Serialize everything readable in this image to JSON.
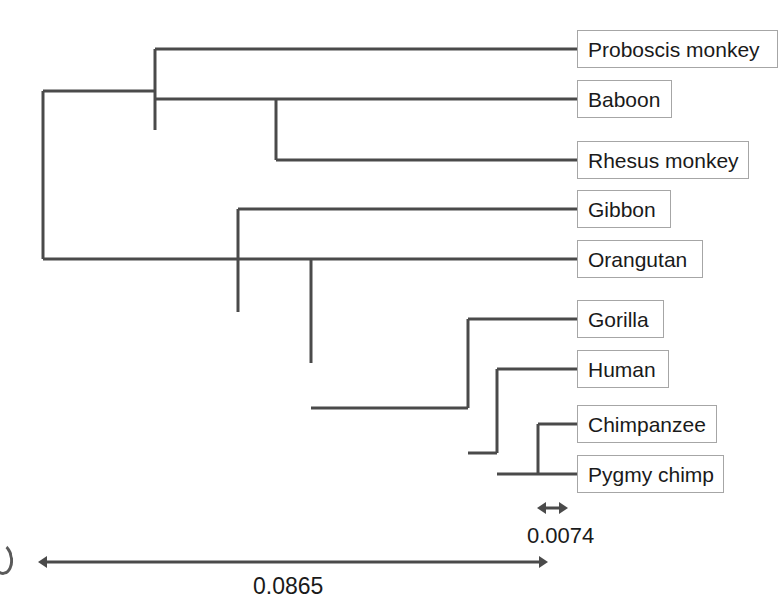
{
  "figure": {
    "type": "phylogenetic-tree",
    "orientation": "left-to-right",
    "background_color": "#ffffff",
    "branch_color": "#4a4a4a",
    "branch_width_px": 3,
    "label_box_border_color": "#a6a6a6",
    "text_color": "#1a1a1a"
  },
  "taxa": [
    {
      "id": "proboscis-monkey",
      "label": "Proboscis monkey",
      "tip_y": 49,
      "box_left": 577,
      "box_width": 201
    },
    {
      "id": "baboon",
      "label": "Baboon",
      "tip_y": 99,
      "box_left": 577,
      "box_width": 95
    },
    {
      "id": "rhesus-monkey",
      "label": "Rhesus monkey",
      "tip_y": 160,
      "box_left": 577,
      "box_width": 172
    },
    {
      "id": "gibbon",
      "label": "Gibbon",
      "tip_y": 209,
      "box_left": 577,
      "box_width": 94
    },
    {
      "id": "orangutan",
      "label": "Orangutan",
      "tip_y": 259,
      "box_left": 577,
      "box_width": 126
    },
    {
      "id": "gorilla",
      "label": "Gorilla",
      "tip_y": 319,
      "box_left": 577,
      "box_width": 87
    },
    {
      "id": "human",
      "label": "Human",
      "tip_y": 369,
      "box_left": 577,
      "box_width": 92
    },
    {
      "id": "chimpanzee",
      "label": "Chimpanzee",
      "tip_y": 424,
      "box_left": 577,
      "box_width": 140
    },
    {
      "id": "pygmy-chimp",
      "label": "Pygmy chimp",
      "tip_y": 474,
      "box_left": 577,
      "box_width": 147
    }
  ],
  "tree_structure": {
    "root": {
      "x": 43,
      "y_top": 91,
      "y_bottom": 259
    },
    "internal_nodes": [
      {
        "id": "old-world-monkeys",
        "x": 155,
        "y_top": 49,
        "y_bottom": 130,
        "parent_x": 43
      },
      {
        "id": "baboon-rhesus",
        "x": 276,
        "y_top": 99,
        "y_bottom": 160,
        "parent_x": 155
      },
      {
        "id": "apes",
        "x": 238,
        "y_top": 209,
        "y_bottom": 312,
        "parent_x": 43
      },
      {
        "id": "great-apes",
        "x": 311,
        "y_top": 259,
        "y_bottom": 363,
        "parent_x": 238
      },
      {
        "id": "african-apes",
        "x": 468,
        "y_top": 319,
        "y_bottom": 408,
        "parent_x": 311
      },
      {
        "id": "human-chimp",
        "x": 497,
        "y_top": 369,
        "y_bottom": 453,
        "parent_x": 468
      },
      {
        "id": "chimp-clade",
        "x": 538,
        "y_top": 424,
        "y_bottom": 474,
        "parent_x": 497
      }
    ],
    "tip_line_end_x": 577
  },
  "scale_bars": [
    {
      "id": "scale-small",
      "value": "0.0074",
      "x_start": 537,
      "x_end": 568,
      "y": 508,
      "double_headed": true
    },
    {
      "id": "scale-large",
      "value": "0.0865",
      "x_start": 38,
      "x_end": 548,
      "y": 562,
      "double_headed": true
    }
  ],
  "chart_data": {
    "type": "tree",
    "title": "",
    "leaves": [
      "Proboscis monkey",
      "Baboon",
      "Rhesus monkey",
      "Gibbon",
      "Orangutan",
      "Gorilla",
      "Human",
      "Chimpanzee",
      "Pygmy chimp"
    ],
    "newick": "(((Proboscis monkey,(Baboon,Rhesus monkey)),(Gibbon,(Orangutan,(Gorilla,(Human,(Chimpanzee,Pygmy chimp))))))",
    "scale_bar_values": [
      0.0074,
      0.0865
    ],
    "scale_bar_labels": [
      "0.0074",
      "0.0865"
    ],
    "units": "substitutions per site"
  }
}
